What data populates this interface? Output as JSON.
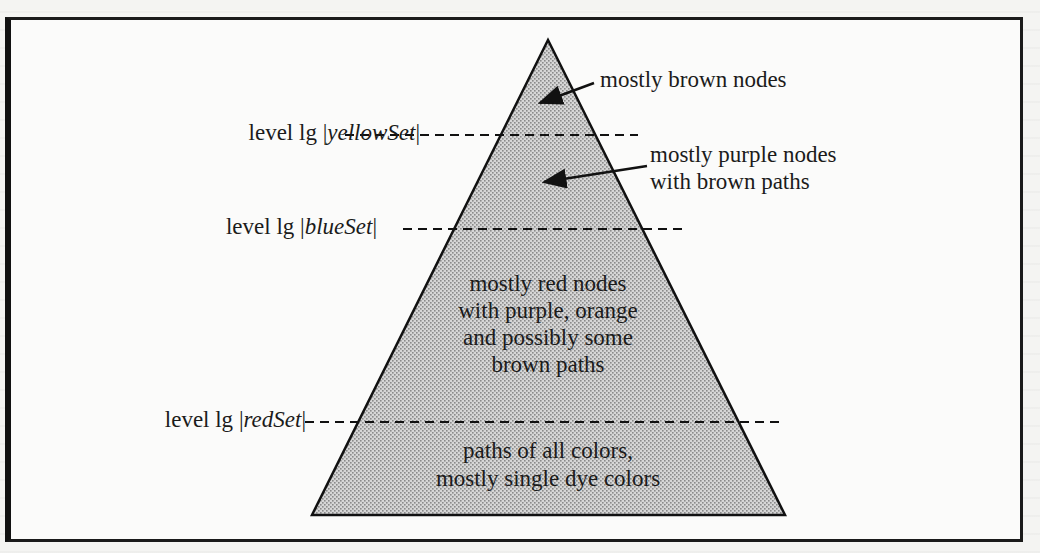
{
  "diagram": {
    "type": "pyramid",
    "fill_pattern": "stippled-gray",
    "levels": [
      {
        "prefix": "level lg ",
        "set": "yellowSet",
        "bar_open": "|",
        "bar_close": "|"
      },
      {
        "prefix": "level lg ",
        "set": "blueSet",
        "bar_open": "|",
        "bar_close": "|"
      },
      {
        "prefix": "level lg ",
        "set": "redSet",
        "bar_open": "|",
        "bar_close": "|"
      }
    ],
    "annotations": {
      "top": "mostly brown nodes",
      "second_line1": "mostly purple nodes",
      "second_line2": "with brown paths"
    },
    "regions": {
      "third": [
        "mostly red nodes",
        "with purple, orange",
        "and possibly some",
        "brown paths"
      ],
      "bottom": [
        "paths of all colors,",
        "mostly single dye colors"
      ]
    }
  },
  "colors": {
    "frame": "#1a1a1a",
    "fill": "#bdbdbd",
    "text": "#1b1b1b",
    "background": "#fbfbfa"
  }
}
